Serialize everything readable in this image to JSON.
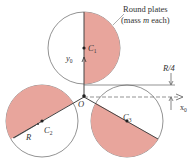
{
  "figure": {
    "title_line1": "Round plates",
    "title_line2_pre": "(mass ",
    "title_line2_var": "m",
    "title_line2_post": " each)",
    "origin_label": "O",
    "x_axis_label": "x",
    "x_axis_sub": "0",
    "y_axis_label": "y",
    "y_axis_sub": "0",
    "offset_label": "R/4",
    "radius_label": "R",
    "plates": [
      {
        "id": "plate-1",
        "center_label": "C",
        "center_sub": "1"
      },
      {
        "id": "plate-2",
        "center_label": "C",
        "center_sub": "2"
      },
      {
        "id": "plate-3",
        "center_label": "C",
        "center_sub": "3"
      }
    ],
    "colors": {
      "shade": "#e8a59c",
      "line": "#555555",
      "text": "#333333"
    }
  }
}
